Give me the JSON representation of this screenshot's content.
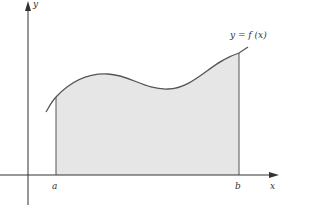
{
  "figure": {
    "curve_label": "y = f (x)",
    "x_axis_label": "x",
    "y_axis_label": "y",
    "lower_bound_label": "a",
    "upper_bound_label": "b",
    "caption": "",
    "colors": {
      "axis": "#333333",
      "curve": "#555555",
      "fill": "#e6e6e6",
      "background": "#ffffff"
    }
  }
}
